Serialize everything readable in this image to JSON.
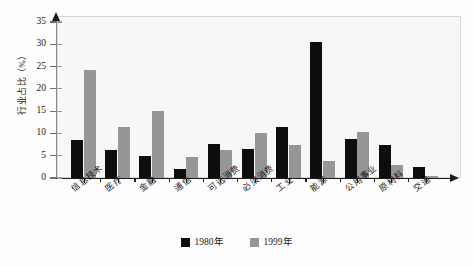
{
  "chart_data": {
    "type": "bar",
    "title": "",
    "xlabel": "",
    "ylabel": "行业占比（%）",
    "ylim": [
      0,
      35
    ],
    "yticks": [
      0,
      5,
      10,
      15,
      20,
      25,
      30,
      35
    ],
    "grid": false,
    "legend_position": "bottom-center",
    "categories": [
      "信息技术",
      "医疗",
      "金融",
      "通信",
      "可选消费",
      "必须消费",
      "工业",
      "能源",
      "公用事业",
      "原材料",
      "交通"
    ],
    "series": [
      {
        "name": "1980年",
        "color": "#0d0d0d",
        "values": [
          8.5,
          6.3,
          5.0,
          2.0,
          7.6,
          6.6,
          11.4,
          30.5,
          8.8,
          7.5,
          2.5
        ]
      },
      {
        "name": "1999年",
        "color": "#969696",
        "values": [
          24.2,
          11.4,
          15.0,
          4.7,
          6.2,
          10.1,
          7.4,
          3.9,
          10.3,
          3.0,
          0.4
        ]
      }
    ]
  },
  "axis": {
    "y_title": "行业占比（%）",
    "tick_labels": [
      "0",
      "5",
      "10",
      "15",
      "20",
      "25",
      "30",
      "35"
    ]
  },
  "legend": {
    "items": [
      {
        "label": "1980年",
        "color": "#0d0d0d"
      },
      {
        "label": "1999年",
        "color": "#969696"
      }
    ]
  }
}
